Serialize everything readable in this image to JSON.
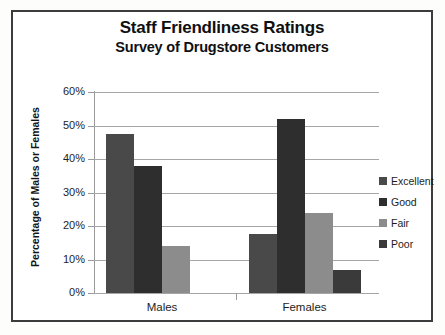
{
  "chart_data": {
    "type": "bar",
    "title": "Staff Friendliness Ratings",
    "subtitle": "Survey of Drugstore Customers",
    "xlabel": "",
    "ylabel": "Percentage of Males or Females",
    "categories": [
      "Males",
      "Females"
    ],
    "series": [
      {
        "name": "Excellent",
        "values": [
          47.5,
          17.5
        ],
        "color": "#494949"
      },
      {
        "name": "Good",
        "values": [
          38.0,
          52.0
        ],
        "color": "#2e2e2e"
      },
      {
        "name": "Fair",
        "values": [
          14.0,
          24.0
        ],
        "color": "#8c8c8c"
      },
      {
        "name": "Poor",
        "values": [
          0.0,
          7.0
        ],
        "color": "#3a3a3a"
      }
    ],
    "ylim": [
      0,
      60
    ],
    "y_ticks": [
      0,
      10,
      20,
      30,
      40,
      50,
      60
    ],
    "y_tick_labels": [
      "0%",
      "10%",
      "20%",
      "30%",
      "40%",
      "50%",
      "60%"
    ],
    "grid": true,
    "legend_position": "right",
    "value_format": "percent"
  },
  "figure": {
    "border_color": "#3c3c3c",
    "background_color": "#ffffff",
    "page_background": "#fdfdfc",
    "gridline_color": "#a6a6a6",
    "axis_color": "#9a9a9a",
    "text_color": "#1d1d1d"
  }
}
